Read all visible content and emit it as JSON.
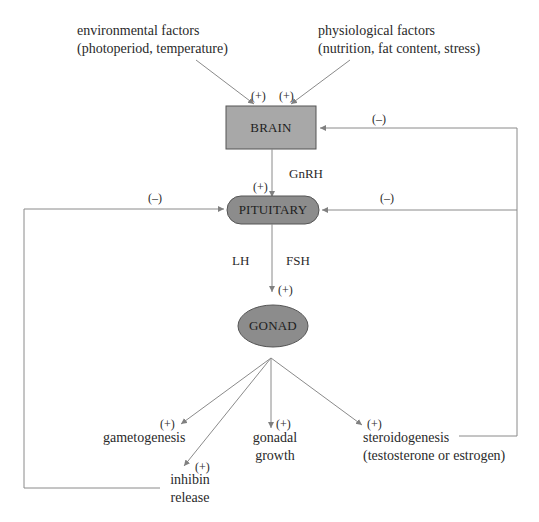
{
  "diagram": {
    "type": "flowchart",
    "title": "",
    "nodes": {
      "brain": {
        "label": "BRAIN",
        "shape": "rectangle",
        "fill": "#a8a8a8"
      },
      "pituitary": {
        "label": "PITUITARY",
        "shape": "rounded-rectangle",
        "fill": "#8c8c8c"
      },
      "gonad": {
        "label": "GONAD",
        "shape": "ellipse",
        "fill": "#8c8c8c"
      }
    },
    "inputs": {
      "environmental": {
        "line1": "environmental factors",
        "line2": "(photoperiod, temperature)"
      },
      "physiological": {
        "line1": "physiological factors",
        "line2": "(nutrition, fat content, stress)"
      }
    },
    "hormones": {
      "gnrh": "GnRH",
      "lh": "LH",
      "fsh": "FSH"
    },
    "outputs": {
      "gametogenesis": {
        "line1": "gametogenesis"
      },
      "inhibin": {
        "line1": "inhibin",
        "line2": "release"
      },
      "gonadal_growth": {
        "line1": "gonadal",
        "line2": "growth"
      },
      "steroidogenesis": {
        "line1": "steroidogenesis",
        "line2": "(testosterone or estrogen)"
      }
    },
    "signs": {
      "positive": "(+)",
      "negative": "(–)"
    },
    "edges": [
      {
        "from": "environmental",
        "to": "brain",
        "sign": "(+)"
      },
      {
        "from": "physiological",
        "to": "brain",
        "sign": "(+)"
      },
      {
        "from": "brain",
        "to": "pituitary",
        "label": "GnRH",
        "sign": "(+)"
      },
      {
        "from": "pituitary",
        "to": "gonad",
        "label": "LH FSH",
        "sign": "(+)"
      },
      {
        "from": "gonad",
        "to": "gametogenesis",
        "sign": "(+)"
      },
      {
        "from": "gonad",
        "to": "inhibin",
        "sign": "(+)"
      },
      {
        "from": "gonad",
        "to": "gonadal_growth",
        "sign": "(+)"
      },
      {
        "from": "gonad",
        "to": "steroidogenesis",
        "sign": "(+)"
      },
      {
        "from": "steroidogenesis",
        "to": "brain",
        "sign": "(–)"
      },
      {
        "from": "steroidogenesis",
        "to": "pituitary",
        "sign": "(–)"
      },
      {
        "from": "inhibin",
        "to": "pituitary",
        "sign": "(–)"
      }
    ],
    "colors": {
      "line": "#8a8a8a",
      "brain_fill": "#a8a8a8",
      "node_fill": "#8c8c8c",
      "node_stroke": "#555555"
    }
  }
}
